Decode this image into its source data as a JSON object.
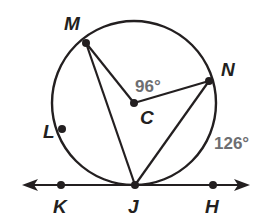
{
  "diagram": {
    "type": "circle-geometry",
    "circle": {
      "center_label": "C",
      "cx": 134,
      "cy": 103,
      "r": 82
    },
    "points": {
      "M": {
        "label": "M",
        "x": 86,
        "y": 43,
        "lx": 64,
        "ly": 30
      },
      "N": {
        "label": "N",
        "x": 209,
        "y": 81,
        "lx": 221,
        "ly": 76
      },
      "C": {
        "label": "C",
        "x": 134,
        "y": 103,
        "lx": 140,
        "ly": 124
      },
      "L": {
        "label": "L",
        "x": 62,
        "y": 129,
        "lx": 43,
        "ly": 138
      },
      "J": {
        "label": "J",
        "x": 135,
        "y": 185,
        "lx": 128,
        "ly": 213
      },
      "K": {
        "label": "K",
        "x": 61,
        "y": 185,
        "lx": 53,
        "ly": 213
      },
      "H": {
        "label": "H",
        "x": 213,
        "y": 185,
        "lx": 205,
        "ly": 213
      }
    },
    "angle_labels": {
      "central_angle": "96°",
      "arc_NJ": "126°"
    },
    "tangent_line": {
      "through": "K-J-H",
      "y": 185,
      "x_start": 22,
      "x_end": 250
    },
    "segments": [
      "MJ",
      "MC",
      "CN",
      "NJ"
    ],
    "colors": {
      "stroke": "#231f20",
      "degree_text": "#6d6e71"
    }
  }
}
